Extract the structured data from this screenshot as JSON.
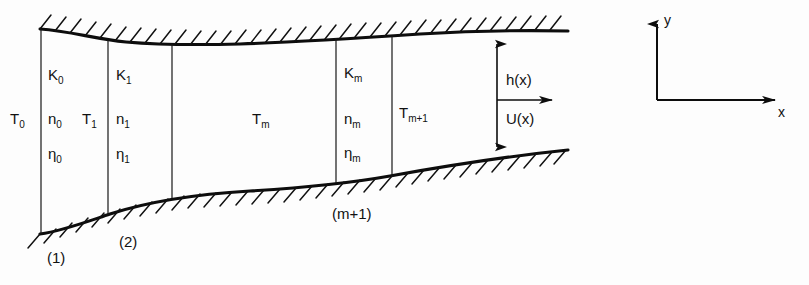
{
  "figure": {
    "background_color": "#fdfdfd",
    "line_color": "#0d0d0d",
    "width": 809,
    "height": 285
  },
  "sections": [
    {
      "id": "section-0",
      "interface_label": "T",
      "interface_sub": "0",
      "layer_labels": [
        {
          "symbol": "K",
          "sub": "0"
        },
        {
          "symbol": "n",
          "sub": "0"
        },
        {
          "symbol": "η",
          "sub": "0"
        }
      ],
      "station_label": "(1)"
    },
    {
      "id": "section-1",
      "interface_label": "T",
      "interface_sub": "1",
      "layer_labels": [
        {
          "symbol": "K",
          "sub": "1"
        },
        {
          "symbol": "n",
          "sub": "1"
        },
        {
          "symbol": "η",
          "sub": "1"
        }
      ],
      "station_label": "(2)"
    },
    {
      "id": "section-m",
      "interface_label": "T",
      "interface_sub": "m",
      "layer_labels": [
        {
          "symbol": "K",
          "sub": "m"
        },
        {
          "symbol": "n",
          "sub": "m"
        },
        {
          "symbol": "η",
          "sub": "m"
        }
      ],
      "station_label": "(m+1)"
    },
    {
      "id": "section-m-plus-1",
      "interface_label": "T",
      "interface_sub": "m+1",
      "layer_labels": [],
      "station_label": ""
    }
  ],
  "annotations": {
    "height_label": "h(x)",
    "velocity_label": "U(x)",
    "station_1": "(1)",
    "station_2": "(2)",
    "station_m_plus_1": "(m+1)"
  },
  "axes": {
    "x_label": "x",
    "y_label": "y",
    "origin_x": 657,
    "origin_y": 100
  },
  "labels": {
    "T0": "T",
    "T0_sub": "0",
    "T1": "T",
    "T1_sub": "1",
    "Tm": "T",
    "Tm_sub": "m",
    "Tm1": "T",
    "Tm1_sub": "m+1",
    "K0": "K",
    "K0_sub": "0",
    "n0": "n",
    "n0_sub": "0",
    "eta0": "η",
    "eta0_sub": "0",
    "K1": "K",
    "K1_sub": "1",
    "n1": "n",
    "n1_sub": "1",
    "eta1": "η",
    "eta1_sub": "1",
    "Km": "K",
    "Km_sub": "m",
    "nm": "n",
    "nm_sub": "m",
    "etam": "η",
    "etam_sub": "m"
  }
}
